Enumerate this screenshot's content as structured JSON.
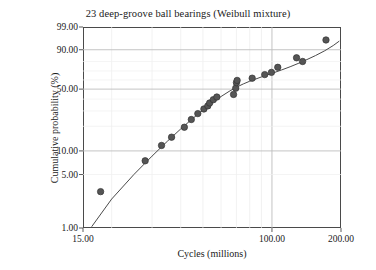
{
  "chart_data": {
    "type": "scatter",
    "title": "23 deep-groove ball bearings (Weibull mixture)",
    "xlabel": "Cycles (millions)",
    "ylabel": "Cumulative probability (%)",
    "xscale": "log",
    "yscale": "weibull-probability",
    "xlim": [
      15.0,
      200.0
    ],
    "ylim": [
      1.0,
      99.0
    ],
    "grid": true,
    "legend": "none",
    "xticks": [
      {
        "value": 15.0,
        "label": "15.00"
      },
      {
        "value": 100.0,
        "label": "100.00"
      },
      {
        "value": 200.0,
        "label": "200.00"
      }
    ],
    "yticks": [
      {
        "value": 1.0,
        "label": "1.00"
      },
      {
        "value": 5.0,
        "label": "5.00"
      },
      {
        "value": 10.0,
        "label": "10.00"
      },
      {
        "value": 50.0,
        "label": "50.00"
      },
      {
        "value": 90.0,
        "label": "90.00"
      },
      {
        "value": 99.0,
        "label": "99.00"
      }
    ],
    "xgridlines": [
      20,
      30,
      40,
      50,
      60,
      70,
      80,
      90,
      100,
      200
    ],
    "ygridlines": [
      5,
      10,
      20,
      30,
      40,
      50,
      60,
      70,
      80,
      90
    ],
    "n_points": 23,
    "marker": {
      "shape": "circle",
      "size": 3.2,
      "color": "#555555",
      "edge": "#333333"
    },
    "line": {
      "label": "fitted Weibull mixture",
      "color": "#4a4a4a",
      "width": 1.0
    },
    "series": [
      {
        "name": "23 deep-groove ball bearings",
        "points": [
          {
            "x": 17.9,
            "y": 3.0
          },
          {
            "x": 28.0,
            "y": 7.5
          },
          {
            "x": 33.0,
            "y": 11.7
          },
          {
            "x": 36.5,
            "y": 14.8
          },
          {
            "x": 41.5,
            "y": 19.5
          },
          {
            "x": 44.5,
            "y": 24.0
          },
          {
            "x": 47.5,
            "y": 28.0
          },
          {
            "x": 50.5,
            "y": 31.5
          },
          {
            "x": 52.5,
            "y": 34.0
          },
          {
            "x": 53.5,
            "y": 36.5
          },
          {
            "x": 55.5,
            "y": 39.5
          },
          {
            "x": 57.5,
            "y": 42.0
          },
          {
            "x": 68.0,
            "y": 44.5
          },
          {
            "x": 69.5,
            "y": 51.0
          },
          {
            "x": 70.0,
            "y": 57.0
          },
          {
            "x": 70.5,
            "y": 59.5
          },
          {
            "x": 82.0,
            "y": 62.0
          },
          {
            "x": 93.0,
            "y": 66.0
          },
          {
            "x": 99.5,
            "y": 68.5
          },
          {
            "x": 106.0,
            "y": 74.0
          },
          {
            "x": 128.0,
            "y": 83.5
          },
          {
            "x": 136.0,
            "y": 80.0
          },
          {
            "x": 172.0,
            "y": 95.5
          }
        ]
      }
    ],
    "fit_curve": [
      {
        "x": 16.4,
        "y": 1.05
      },
      {
        "x": 20.0,
        "y": 2.4
      },
      {
        "x": 25.0,
        "y": 5.0
      },
      {
        "x": 30.0,
        "y": 8.6
      },
      {
        "x": 35.0,
        "y": 13.2
      },
      {
        "x": 40.0,
        "y": 18.6
      },
      {
        "x": 45.0,
        "y": 24.5
      },
      {
        "x": 50.0,
        "y": 30.6
      },
      {
        "x": 55.0,
        "y": 36.8
      },
      {
        "x": 60.0,
        "y": 42.5
      },
      {
        "x": 65.0,
        "y": 47.6
      },
      {
        "x": 70.0,
        "y": 52.0
      },
      {
        "x": 75.0,
        "y": 55.6
      },
      {
        "x": 80.0,
        "y": 58.6
      },
      {
        "x": 90.0,
        "y": 63.4
      },
      {
        "x": 100.0,
        "y": 67.4
      },
      {
        "x": 110.0,
        "y": 71.1
      },
      {
        "x": 120.0,
        "y": 74.6
      },
      {
        "x": 130.0,
        "y": 78.0
      },
      {
        "x": 140.0,
        "y": 81.2
      },
      {
        "x": 155.0,
        "y": 85.5
      },
      {
        "x": 170.0,
        "y": 89.3
      },
      {
        "x": 185.0,
        "y": 92.7
      },
      {
        "x": 196.0,
        "y": 94.9
      }
    ]
  }
}
